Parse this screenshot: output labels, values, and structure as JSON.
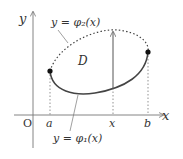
{
  "diagram": {
    "axes": {
      "x_label": "x",
      "y_label": "y",
      "origin_label": "O"
    },
    "ticks": {
      "a": "a",
      "x": "x",
      "b": "b"
    },
    "region_label": "D",
    "upper_curve": {
      "label": "y = φ₂(x)",
      "style": "dotted"
    },
    "lower_curve": {
      "label": "y = φ₁(x)",
      "style": "solid"
    },
    "colors": {
      "stroke": "#555555",
      "text": "#333333",
      "point": "#111111"
    }
  }
}
